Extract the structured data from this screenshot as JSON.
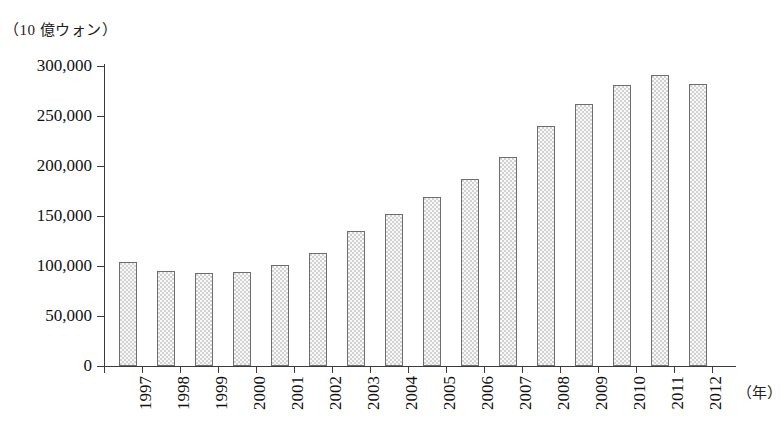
{
  "chart_data": {
    "type": "bar",
    "title": "",
    "xlabel": "（年）",
    "ylabel": "（10 億ウォン）",
    "unit_label": "（10 億ウォン）",
    "year_label": "（年）",
    "categories": [
      "1997",
      "1998",
      "1999",
      "2000",
      "2001",
      "2002",
      "2003",
      "2004",
      "2005",
      "2006",
      "2007",
      "2008",
      "2009",
      "2010",
      "2011",
      "2012"
    ],
    "values": [
      104000,
      95000,
      93000,
      94000,
      101000,
      113000,
      135000,
      152000,
      169000,
      187000,
      209000,
      240000,
      262000,
      281000,
      291000,
      282000
    ],
    "ylim": [
      0,
      300000
    ],
    "ytick_values": [
      0,
      50000,
      100000,
      150000,
      200000,
      250000,
      300000
    ],
    "ytick_labels": [
      "0",
      "50,000",
      "100,000",
      "150,000",
      "200,000",
      "250,000",
      "300,000"
    ],
    "grid": false,
    "legend": null,
    "series": [
      {
        "name": "",
        "values": [
          104000,
          95000,
          93000,
          94000,
          101000,
          113000,
          135000,
          152000,
          169000,
          187000,
          209000,
          240000,
          262000,
          281000,
          291000,
          282000
        ]
      }
    ],
    "bar_fill_color": "#d2d2d2",
    "bar_border_color": "#6e6e6e",
    "axis_color": "#3b3b3b"
  }
}
